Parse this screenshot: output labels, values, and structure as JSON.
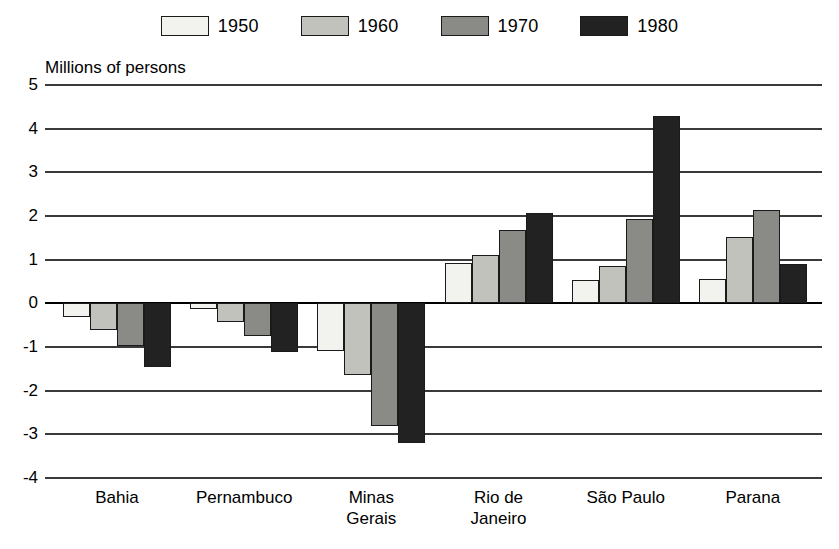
{
  "chart_data": {
    "type": "bar",
    "title": "Millions of persons",
    "xlabel": "",
    "ylabel": "Millions of persons",
    "ylim": [
      -4,
      5
    ],
    "ytick_labels": [
      "5",
      "4",
      "3",
      "2",
      "1",
      "0",
      "-1",
      "-2",
      "-3",
      "-4"
    ],
    "ytick_values": [
      5,
      4,
      3,
      2,
      1,
      0,
      -1,
      -2,
      -3,
      -4
    ],
    "grid": true,
    "legend_position": "top-center",
    "categories": [
      "Bahia",
      "Pernambuco",
      "Minas\nGerais",
      "Rio de\nJaneiro",
      "São Paulo",
      "Parana"
    ],
    "series": [
      {
        "name": "1950",
        "color": "#f2f2ee",
        "values": [
          -0.32,
          -0.12,
          -1.1,
          0.92,
          0.53,
          0.55
        ]
      },
      {
        "name": "1960",
        "color": "#c2c2bd",
        "values": [
          -0.62,
          -0.42,
          -1.65,
          1.1,
          0.85,
          1.53
        ]
      },
      {
        "name": "1970",
        "color": "#8a8a86",
        "values": [
          -0.98,
          -0.75,
          -2.8,
          1.67,
          1.92,
          2.13
        ]
      },
      {
        "name": "1980",
        "color": "#222222",
        "values": [
          -1.45,
          -1.12,
          -3.2,
          2.08,
          4.3,
          0.9
        ]
      }
    ]
  },
  "legend": {
    "items": [
      {
        "label": "1950"
      },
      {
        "label": "1960"
      },
      {
        "label": "1970"
      },
      {
        "label": "1980"
      }
    ]
  }
}
